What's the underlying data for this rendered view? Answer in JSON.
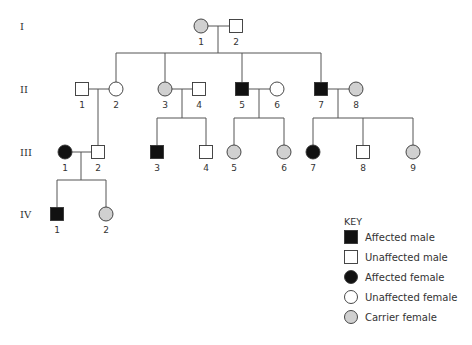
{
  "colors": {
    "affected": "#111111",
    "unaffected": "#ffffff",
    "carrier": "#d0d0d0",
    "line": "#555555"
  },
  "generations": [
    {
      "label": "I",
      "y": 26
    },
    {
      "label": "II",
      "y": 89
    },
    {
      "label": "III",
      "y": 152
    },
    {
      "label": "IV",
      "y": 214
    }
  ],
  "individuals": [
    {
      "id": "I-1",
      "num": "1",
      "gen": 0,
      "x": 201,
      "sex": "female",
      "status": "carrier"
    },
    {
      "id": "I-2",
      "num": "2",
      "gen": 0,
      "x": 236,
      "sex": "male",
      "status": "unaffected"
    },
    {
      "id": "II-1",
      "num": "1",
      "gen": 1,
      "x": 82,
      "sex": "male",
      "status": "unaffected"
    },
    {
      "id": "II-2",
      "num": "2",
      "gen": 1,
      "x": 116,
      "sex": "female",
      "status": "unaffected"
    },
    {
      "id": "II-3",
      "num": "3",
      "gen": 1,
      "x": 165,
      "sex": "female",
      "status": "carrier"
    },
    {
      "id": "II-4",
      "num": "4",
      "gen": 1,
      "x": 199,
      "sex": "male",
      "status": "unaffected"
    },
    {
      "id": "II-5",
      "num": "5",
      "gen": 1,
      "x": 242,
      "sex": "male",
      "status": "affected"
    },
    {
      "id": "II-6",
      "num": "6",
      "gen": 1,
      "x": 277,
      "sex": "female",
      "status": "unaffected"
    },
    {
      "id": "II-7",
      "num": "7",
      "gen": 1,
      "x": 321,
      "sex": "male",
      "status": "affected"
    },
    {
      "id": "II-8",
      "num": "8",
      "gen": 1,
      "x": 356,
      "sex": "female",
      "status": "carrier"
    },
    {
      "id": "III-1",
      "num": "1",
      "gen": 2,
      "x": 65,
      "sex": "female",
      "status": "affected"
    },
    {
      "id": "III-2",
      "num": "2",
      "gen": 2,
      "x": 98,
      "sex": "male",
      "status": "unaffected"
    },
    {
      "id": "III-3",
      "num": "3",
      "gen": 2,
      "x": 157,
      "sex": "male",
      "status": "affected"
    },
    {
      "id": "III-4",
      "num": "4",
      "gen": 2,
      "x": 206,
      "sex": "male",
      "status": "unaffected"
    },
    {
      "id": "III-5",
      "num": "5",
      "gen": 2,
      "x": 234,
      "sex": "female",
      "status": "carrier"
    },
    {
      "id": "III-6",
      "num": "6",
      "gen": 2,
      "x": 284,
      "sex": "female",
      "status": "carrier"
    },
    {
      "id": "III-7",
      "num": "7",
      "gen": 2,
      "x": 313,
      "sex": "female",
      "status": "affected"
    },
    {
      "id": "III-8",
      "num": "8",
      "gen": 2,
      "x": 363,
      "sex": "male",
      "status": "unaffected"
    },
    {
      "id": "III-9",
      "num": "9",
      "gen": 2,
      "x": 413,
      "sex": "female",
      "status": "carrier"
    },
    {
      "id": "IV-1",
      "num": "1",
      "gen": 3,
      "x": 57,
      "sex": "male",
      "status": "affected"
    },
    {
      "id": "IV-2",
      "num": "2",
      "gen": 3,
      "x": 106,
      "sex": "female",
      "status": "carrier"
    }
  ],
  "lines": [
    [
      208,
      26,
      229,
      26
    ],
    [
      218,
      26,
      218,
      53
    ],
    [
      116,
      53,
      321,
      53
    ],
    [
      116,
      53,
      116,
      82
    ],
    [
      165,
      53,
      165,
      82
    ],
    [
      242,
      53,
      242,
      82
    ],
    [
      321,
      53,
      321,
      82
    ],
    [
      88,
      89,
      109,
      89
    ],
    [
      98,
      89,
      98,
      146
    ],
    [
      172,
      89,
      193,
      89
    ],
    [
      182,
      89,
      182,
      118
    ],
    [
      157,
      118,
      206,
      118
    ],
    [
      157,
      118,
      157,
      146
    ],
    [
      206,
      118,
      206,
      146
    ],
    [
      248,
      89,
      270,
      89
    ],
    [
      259,
      89,
      259,
      118
    ],
    [
      234,
      118,
      284,
      118
    ],
    [
      234,
      118,
      234,
      145
    ],
    [
      284,
      118,
      284,
      145
    ],
    [
      327,
      89,
      349,
      89
    ],
    [
      338,
      89,
      338,
      118
    ],
    [
      313,
      118,
      413,
      118
    ],
    [
      313,
      118,
      313,
      145
    ],
    [
      363,
      118,
      363,
      146
    ],
    [
      413,
      118,
      413,
      145
    ],
    [
      72,
      152,
      92,
      152
    ],
    [
      81,
      152,
      81,
      180
    ],
    [
      57,
      180,
      106,
      180
    ],
    [
      57,
      180,
      57,
      208
    ],
    [
      106,
      180,
      106,
      207
    ]
  ],
  "key": {
    "title": "KEY",
    "items": [
      {
        "label": "Affected male",
        "sex": "male",
        "status": "affected"
      },
      {
        "label": "Unaffected male",
        "sex": "male",
        "status": "unaffected"
      },
      {
        "label": "Affected female",
        "sex": "female",
        "status": "affected"
      },
      {
        "label": "Unaffected female",
        "sex": "female",
        "status": "unaffected"
      },
      {
        "label": "Carrier female",
        "sex": "female",
        "status": "carrier"
      }
    ]
  }
}
